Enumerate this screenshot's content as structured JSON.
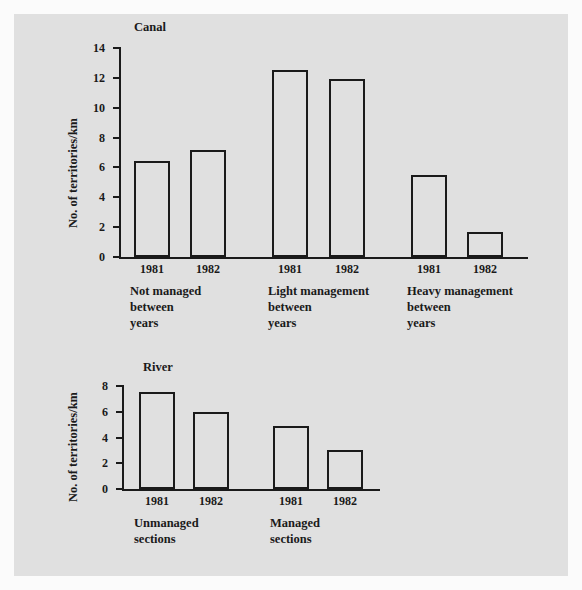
{
  "figure": {
    "background_color": "#e0e0e0",
    "frame_color": "#fbfbfb",
    "ink_color": "#1a1a1a"
  },
  "chart_data": [
    {
      "type": "bar",
      "title": "Canal",
      "ylabel": "No. of territories/km",
      "xlabel": "",
      "ylim": [
        0,
        14
      ],
      "yticks": [
        0,
        2,
        4,
        6,
        8,
        10,
        12,
        14
      ],
      "grid": false,
      "legend": "none",
      "categories": [
        "1981",
        "1982",
        "1981",
        "1982",
        "1981",
        "1982"
      ],
      "values": [
        6.4,
        7.15,
        12.5,
        11.9,
        5.5,
        1.7
      ],
      "groups": [
        {
          "label": "Not managed\nbetween\nyears",
          "categories": [
            "1981",
            "1982"
          ],
          "values": [
            6.4,
            7.15
          ]
        },
        {
          "label": "Light management\nbetween\nyears",
          "categories": [
            "1981",
            "1982"
          ],
          "values": [
            12.5,
            11.9
          ]
        },
        {
          "label": "Heavy management\nbetween\nyears",
          "categories": [
            "1981",
            "1982"
          ],
          "values": [
            5.5,
            1.7
          ]
        }
      ]
    },
    {
      "type": "bar",
      "title": "River",
      "ylabel": "No. of territories/km",
      "xlabel": "",
      "ylim": [
        0,
        8
      ],
      "yticks": [
        0,
        2,
        4,
        6,
        8
      ],
      "grid": false,
      "legend": "none",
      "categories": [
        "1981",
        "1982",
        "1981",
        "1982"
      ],
      "values": [
        7.5,
        5.95,
        4.9,
        3.0
      ],
      "groups": [
        {
          "label": "Unmanaged\nsections",
          "categories": [
            "1981",
            "1982"
          ],
          "values": [
            7.5,
            5.95
          ]
        },
        {
          "label": "Managed\nsections",
          "categories": [
            "1981",
            "1982"
          ],
          "values": [
            4.9,
            3.0
          ]
        }
      ]
    }
  ],
  "canal": {
    "title": "Canal",
    "ylabel": "No. of territories/km",
    "yticks": [
      "14",
      "12",
      "10",
      "8",
      "6",
      "4",
      "2",
      "0"
    ],
    "bars": [
      {
        "year": "1981",
        "value": 6.4
      },
      {
        "year": "1982",
        "value": 7.15
      },
      {
        "year": "1981",
        "value": 12.5
      },
      {
        "year": "1982",
        "value": 11.9
      },
      {
        "year": "1981",
        "value": 5.5
      },
      {
        "year": "1982",
        "value": 1.7
      }
    ],
    "groups": [
      {
        "label": "Not managed\nbetween\nyears"
      },
      {
        "label": "Light management\nbetween\nyears"
      },
      {
        "label": "Heavy management\nbetween\nyears"
      }
    ]
  },
  "river": {
    "title": "River",
    "ylabel": "No. of territories/km",
    "yticks": [
      "8",
      "6",
      "4",
      "2",
      "0"
    ],
    "bars": [
      {
        "year": "1981",
        "value": 7.5
      },
      {
        "year": "1982",
        "value": 5.95
      },
      {
        "year": "1981",
        "value": 4.9
      },
      {
        "year": "1982",
        "value": 3.0
      }
    ],
    "groups": [
      {
        "label": "Unmanaged\nsections"
      },
      {
        "label": "Managed\nsections"
      }
    ]
  }
}
